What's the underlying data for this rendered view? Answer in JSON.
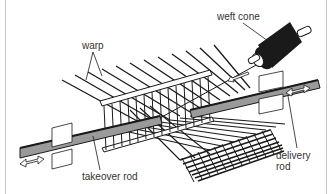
{
  "diagram": {
    "type": "technical-illustration",
    "labels": {
      "warp": "warp",
      "weft_cone": "weft cone",
      "takeover_rod": "takeover rod",
      "delivery_rod_line1": "delivery",
      "delivery_rod_line2": "rod"
    },
    "components": [
      {
        "id": "warp",
        "name": "warp threads"
      },
      {
        "id": "weft-cone",
        "name": "weft cone"
      },
      {
        "id": "takeover-rod",
        "name": "takeover rod"
      },
      {
        "id": "delivery-rod",
        "name": "delivery rod"
      },
      {
        "id": "reed",
        "name": "reed / comb frame"
      },
      {
        "id": "woven-fabric",
        "name": "woven fabric"
      },
      {
        "id": "left-block",
        "name": "rod guide block (left)"
      },
      {
        "id": "right-block",
        "name": "rod guide block (right)"
      },
      {
        "id": "left-arrow",
        "name": "double-headed motion arrow (left)"
      },
      {
        "id": "right-arrow",
        "name": "double-headed motion arrow (right)"
      },
      {
        "id": "weft-arrow",
        "name": "weft feed direction arrow"
      }
    ],
    "colors": {
      "ink": "#1a1a1a",
      "rod_fill": "#9a9a9a",
      "frame": "#c8c8c8",
      "background": "#ffffff"
    }
  }
}
